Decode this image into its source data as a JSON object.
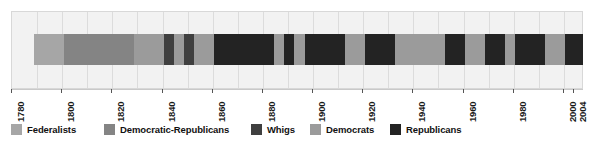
{
  "chart_data": {
    "type": "bar",
    "title": "",
    "subtitle": "",
    "xlabel": "",
    "ylabel": "",
    "orientation": "horizontal-timeline",
    "grid": true,
    "legend_position": "bottom",
    "xlim": [
      1780,
      2008
    ],
    "axis_ticks": [
      {
        "year": 1780,
        "label": "1780"
      },
      {
        "year": 1800,
        "label": "1800"
      },
      {
        "year": 1820,
        "label": "1820"
      },
      {
        "year": 1840,
        "label": "1840"
      },
      {
        "year": 1860,
        "label": "1860"
      },
      {
        "year": 1880,
        "label": "1880"
      },
      {
        "year": 1900,
        "label": "1900"
      },
      {
        "year": 1920,
        "label": "1920"
      },
      {
        "year": 1940,
        "label": "1940"
      },
      {
        "year": 1960,
        "label": "1960"
      },
      {
        "year": 1980,
        "label": "1980"
      },
      {
        "year": 2000,
        "label": "2000"
      },
      {
        "year": 2004,
        "label": "2004"
      }
    ],
    "gridline_years": [
      1790,
      1800,
      1810,
      1820,
      1830,
      1840,
      1850,
      1860,
      1870,
      1880,
      1890,
      1900,
      1910,
      1920,
      1930,
      1940,
      1950,
      1960,
      1970,
      1980,
      1990,
      2000
    ],
    "categories": [
      "Federalists",
      "Democratic-Republicans",
      "Whigs",
      "Democrats",
      "Republicans"
    ],
    "colors": {
      "Federalists": "#a6a6a6",
      "Democratic-Republicans": "#848484",
      "Whigs": "#3f3f3f",
      "Democrats": "#9b9b9b",
      "Republicans": "#232323"
    },
    "segments": [
      {
        "party": "Federalists",
        "start": 1789,
        "end": 1801
      },
      {
        "party": "Democratic-Republicans",
        "start": 1801,
        "end": 1829
      },
      {
        "party": "Democrats",
        "start": 1829,
        "end": 1841
      },
      {
        "party": "Whigs",
        "start": 1841,
        "end": 1845
      },
      {
        "party": "Democrats",
        "start": 1845,
        "end": 1849
      },
      {
        "party": "Whigs",
        "start": 1849,
        "end": 1853
      },
      {
        "party": "Democrats",
        "start": 1853,
        "end": 1861
      },
      {
        "party": "Republicans",
        "start": 1861,
        "end": 1885
      },
      {
        "party": "Democrats",
        "start": 1885,
        "end": 1889
      },
      {
        "party": "Republicans",
        "start": 1889,
        "end": 1893
      },
      {
        "party": "Democrats",
        "start": 1893,
        "end": 1897
      },
      {
        "party": "Republicans",
        "start": 1897,
        "end": 1913
      },
      {
        "party": "Democrats",
        "start": 1913,
        "end": 1921
      },
      {
        "party": "Republicans",
        "start": 1921,
        "end": 1933
      },
      {
        "party": "Democrats",
        "start": 1933,
        "end": 1953
      },
      {
        "party": "Republicans",
        "start": 1953,
        "end": 1961
      },
      {
        "party": "Democrats",
        "start": 1961,
        "end": 1969
      },
      {
        "party": "Republicans",
        "start": 1969,
        "end": 1977
      },
      {
        "party": "Democrats",
        "start": 1977,
        "end": 1981
      },
      {
        "party": "Republicans",
        "start": 1981,
        "end": 1993
      },
      {
        "party": "Democrats",
        "start": 1993,
        "end": 2001
      },
      {
        "party": "Republicans",
        "start": 2001,
        "end": 2008
      }
    ]
  },
  "legend": {
    "items": [
      {
        "label": "Federalists",
        "color": "#a6a6a6",
        "x": 11
      },
      {
        "label": "Democratic-Republicans",
        "color": "#848484",
        "x": 104
      },
      {
        "label": "Whigs",
        "color": "#3f3f3f",
        "x": 251
      },
      {
        "label": "Democrats",
        "color": "#9b9b9b",
        "x": 310
      },
      {
        "label": "Republicans",
        "color": "#232323",
        "x": 390
      }
    ]
  }
}
